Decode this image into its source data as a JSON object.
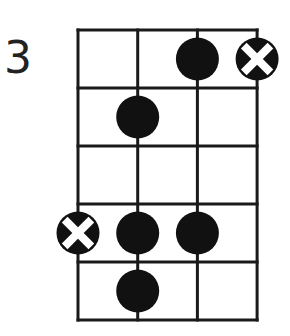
{
  "diagram": {
    "type": "chord-fingering-chart",
    "start_fret_label": "3",
    "strings": 4,
    "frets": 5,
    "grid": {
      "left": 78,
      "top": 30,
      "string_spacing": 59.7,
      "fret_spacing": 58,
      "line_color": "#1a1a1a",
      "line_width": 3
    },
    "dot_color": "#111111",
    "dot_radius": 21.5,
    "markers": [
      {
        "string": 3,
        "fret": 1,
        "kind": "dot"
      },
      {
        "string": 4,
        "fret": 1,
        "kind": "x"
      },
      {
        "string": 2,
        "fret": 2,
        "kind": "dot"
      },
      {
        "string": 1,
        "fret": 4,
        "kind": "x"
      },
      {
        "string": 2,
        "fret": 4,
        "kind": "dot"
      },
      {
        "string": 3,
        "fret": 4,
        "kind": "dot"
      },
      {
        "string": 2,
        "fret": 5,
        "kind": "dot"
      }
    ]
  }
}
